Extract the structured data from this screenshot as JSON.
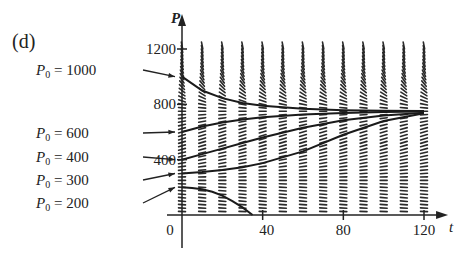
{
  "panel_label": "(d)",
  "chart_data": {
    "type": "line",
    "subtype": "slope_field_with_solution_curves",
    "title": "",
    "xlabel": "t",
    "ylabel": "P",
    "xlim": [
      0,
      125
    ],
    "ylim": [
      0,
      1300
    ],
    "x_ticks": [
      0,
      40,
      80,
      120
    ],
    "x_tick_labels": [
      "0",
      "40",
      "80",
      "120"
    ],
    "y_ticks": [
      400,
      800,
      1200
    ],
    "y_tick_labels": [
      "400",
      "800",
      "1200"
    ],
    "grid": false,
    "legend": null,
    "equilibria": [
      250,
      750
    ],
    "slope_field": {
      "t_columns": [
        0,
        10,
        20,
        30,
        40,
        50,
        60,
        70,
        80,
        90,
        100,
        110,
        120
      ],
      "p_step": 50,
      "p_range": [
        0,
        1200
      ]
    },
    "series": [
      {
        "name": "P0 = 1000",
        "label": "P₀ = 1000",
        "t": [
          0,
          10,
          20,
          30,
          40,
          60,
          80,
          100,
          120
        ],
        "values": [
          1000,
          900,
          845,
          810,
          790,
          768,
          758,
          753,
          751
        ]
      },
      {
        "name": "P0 = 600",
        "label": "P₀ = 600",
        "t": [
          0,
          10,
          20,
          30,
          40,
          60,
          80,
          100,
          120
        ],
        "values": [
          600,
          640,
          668,
          690,
          706,
          727,
          738,
          744,
          748
        ]
      },
      {
        "name": "P0 = 400",
        "label": "P₀ = 400",
        "t": [
          0,
          10,
          20,
          30,
          40,
          60,
          80,
          100,
          120
        ],
        "values": [
          400,
          440,
          480,
          520,
          560,
          630,
          685,
          720,
          740
        ]
      },
      {
        "name": "P0 = 300",
        "label": "P₀ = 300",
        "t": [
          0,
          10,
          20,
          30,
          40,
          60,
          80,
          100,
          120
        ],
        "values": [
          300,
          310,
          325,
          345,
          375,
          460,
          580,
          680,
          735
        ]
      },
      {
        "name": "P0 = 200",
        "label": "P₀ = 200",
        "t": [
          0,
          5,
          10,
          15,
          20,
          25,
          30,
          35
        ],
        "values": [
          200,
          196,
          186,
          168,
          140,
          100,
          55,
          0
        ]
      }
    ]
  }
}
